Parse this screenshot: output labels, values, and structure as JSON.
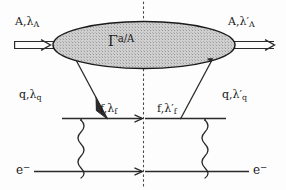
{
  "diagram": {
    "type": "feynman-diagram",
    "colors": {
      "line": "#2b2b2b",
      "blob_fill": "#c9c9c9",
      "blob_stroke": "#1a1a1a",
      "background": "#fdfdfd",
      "cut_line": "#4a4a4a"
    },
    "blob": {
      "name": "gamma-a-over-A",
      "base": "Γ",
      "superscript": "a/A"
    },
    "labels": {
      "incoming_hadron": {
        "base": "A,",
        "greek": "λ",
        "sub": "A"
      },
      "outgoing_hadron": {
        "base": "A,",
        "greek": "λ′",
        "sub": "A"
      },
      "quark_left": {
        "base": "q,",
        "greek": "λ",
        "sub": "q"
      },
      "quark_right": {
        "base": "q,",
        "greek": "λ′",
        "sub": "q"
      },
      "fermion_left": {
        "base": "f,",
        "greek": "λ",
        "sub": "f"
      },
      "fermion_right": {
        "base": "f,",
        "greek": "λ′",
        "sub": "f"
      },
      "electron_in": {
        "base": "e",
        "sup": "−"
      },
      "electron_out": {
        "base": "e",
        "sup": "−"
      }
    },
    "cut": {
      "name": "unitarity-cut",
      "style": "dotted-vertical",
      "x": 143
    }
  }
}
